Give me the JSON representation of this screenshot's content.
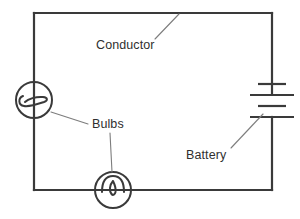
{
  "diagram": {
    "type": "circuit-schematic",
    "background_color": "#ffffff",
    "line_color": "#3a3a3a",
    "leader_color": "#7d7d7d",
    "text_color": "#2f2f2f",
    "labels": {
      "conductor": "Conductor",
      "bulbs": "Bulbs",
      "battery": "Battery"
    },
    "components": [
      {
        "name": "conductor-wire",
        "kind": "wire",
        "description": "rectangular loop of conducting wire"
      },
      {
        "name": "bulb-left",
        "kind": "lamp",
        "description": "lamp symbol on left side of circuit"
      },
      {
        "name": "bulb-bottom",
        "kind": "lamp",
        "description": "lamp symbol on bottom of circuit"
      },
      {
        "name": "battery",
        "kind": "battery",
        "plates": 4,
        "description": "battery symbol with alternating long and short plates on right side"
      }
    ]
  }
}
